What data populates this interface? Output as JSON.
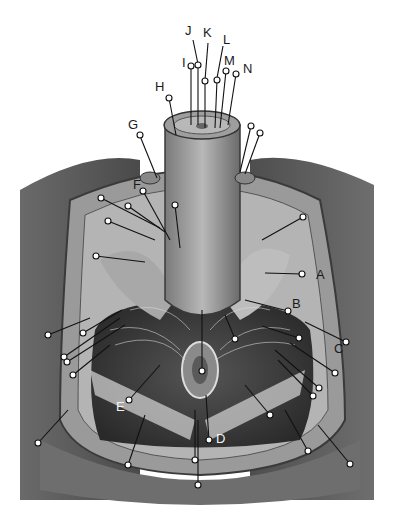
{
  "figure": {
    "labels": [
      {
        "id": "A",
        "text": "A",
        "x": 316,
        "y": 268,
        "tone": "dark"
      },
      {
        "id": "B",
        "text": "B",
        "x": 292,
        "y": 304,
        "tone": "dark"
      },
      {
        "id": "C",
        "text": "C",
        "x": 334,
        "y": 342,
        "tone": "dark"
      },
      {
        "id": "D",
        "text": "D",
        "x": 218,
        "y": 432,
        "tone": "light"
      },
      {
        "id": "E",
        "text": "E",
        "x": 116,
        "y": 400,
        "tone": "light"
      },
      {
        "id": "F",
        "text": "F",
        "x": 133,
        "y": 180,
        "tone": "dark"
      },
      {
        "id": "G",
        "text": "G",
        "x": 128,
        "y": 120,
        "tone": "dark"
      },
      {
        "id": "H",
        "text": "H",
        "x": 157,
        "y": 83,
        "tone": "dark"
      },
      {
        "id": "I",
        "text": "I",
        "x": 183,
        "y": 56,
        "tone": "dark"
      },
      {
        "id": "J",
        "text": "J",
        "x": 186,
        "y": 25,
        "tone": "dark"
      },
      {
        "id": "K",
        "text": "K",
        "x": 204,
        "y": 26,
        "tone": "dark"
      },
      {
        "id": "L",
        "text": "L",
        "x": 224,
        "y": 33,
        "tone": "dark"
      },
      {
        "id": "M",
        "text": "M",
        "x": 225,
        "y": 54,
        "tone": "dark"
      },
      {
        "id": "N",
        "text": "N",
        "x": 243,
        "y": 63,
        "tone": "dark"
      }
    ],
    "colors": {
      "background": "#ffffff",
      "skin_dark": "#5a5a5a",
      "skin_mid": "#8a8a8a",
      "tissue_light": "#c8c8c8",
      "muscle_dark": "#2e2e2e",
      "leader": "#111111",
      "marker_fill": "#ffffff"
    }
  }
}
